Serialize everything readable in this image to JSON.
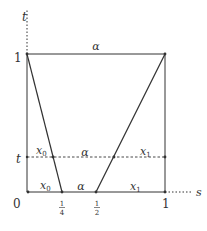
{
  "diagram": {
    "type": "homotopy-square",
    "axes": {
      "vertical_label": "t",
      "horizontal_label": "s"
    },
    "ticks": {
      "origin": "0",
      "s_quarter_num": "1",
      "s_quarter_den": "4",
      "s_half_num": "1",
      "s_half_den": "2",
      "s_one": "1",
      "t_one": "1",
      "t_mid": "t"
    },
    "region_labels": {
      "top_edge": "α",
      "mid_left": "x",
      "mid_left_sub": "0",
      "mid_center": "α",
      "mid_right": "x",
      "mid_right_sub": "1",
      "bottom_left": "x",
      "bottom_left_sub": "0",
      "bottom_center": "α",
      "bottom_right": "x",
      "bottom_right_sub": "1"
    },
    "colors": {
      "line": "#333333",
      "text": "#333333",
      "background": "#ffffff"
    }
  }
}
